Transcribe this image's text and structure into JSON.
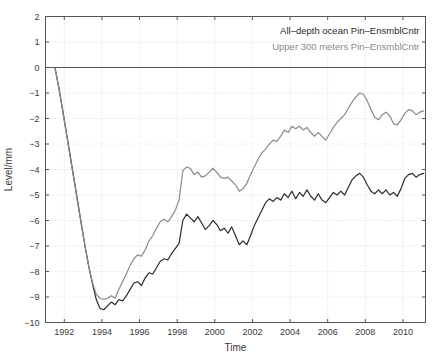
{
  "chart_data": {
    "type": "line",
    "title": "",
    "xlabel": "Time",
    "ylabel": "Level/mm",
    "xlim": [
      1991.0,
      2011.2
    ],
    "ylim": [
      -10,
      2
    ],
    "xticks": [
      1992,
      1994,
      1996,
      1998,
      2000,
      2002,
      2004,
      2006,
      2008,
      2010
    ],
    "xticklabels": [
      "1992",
      "1994",
      "1996",
      "1998",
      "2000",
      "2002",
      "2004",
      "2006",
      "2008",
      "2010"
    ],
    "yticks": [
      2,
      1,
      0,
      -1,
      -2,
      -3,
      -4,
      -5,
      -6,
      -7,
      -8,
      -9,
      -10
    ],
    "yticklabels": [
      "2",
      "1",
      "0",
      "-1",
      "-2",
      "-3",
      "-4",
      "-5",
      "-6",
      "-7",
      "-8",
      "-9",
      "-10"
    ],
    "grid": true,
    "grid_style": "dotted",
    "grid_color": "#cccccc",
    "legend_position": "upper right inside",
    "series": [
      {
        "name": "All-depth ocean Pin-EnsmblCntr",
        "color": "#2b2b2b",
        "linewidth": 1.2,
        "x": [
          1991.5,
          1991.7,
          1991.9,
          1992.1,
          1992.3,
          1992.5,
          1992.7,
          1992.9,
          1993.1,
          1993.3,
          1993.5,
          1993.7,
          1993.9,
          1994.1,
          1994.3,
          1994.5,
          1994.7,
          1994.9,
          1995.1,
          1995.3,
          1995.5,
          1995.7,
          1995.9,
          1996.1,
          1996.3,
          1996.5,
          1996.7,
          1996.9,
          1997.1,
          1997.3,
          1997.5,
          1997.7,
          1997.9,
          1998.1,
          1998.3,
          1998.5,
          1998.7,
          1998.9,
          1999.1,
          1999.3,
          1999.5,
          1999.7,
          1999.9,
          2000.1,
          2000.3,
          2000.5,
          2000.7,
          2000.9,
          2001.1,
          2001.3,
          2001.5,
          2001.7,
          2001.9,
          2002.1,
          2002.3,
          2002.5,
          2002.7,
          2002.9,
          2003.1,
          2003.3,
          2003.5,
          2003.7,
          2003.9,
          2004.1,
          2004.3,
          2004.5,
          2004.7,
          2004.9,
          2005.1,
          2005.3,
          2005.5,
          2005.7,
          2005.9,
          2006.1,
          2006.3,
          2006.5,
          2006.7,
          2006.9,
          2007.1,
          2007.3,
          2007.5,
          2007.7,
          2007.9,
          2008.1,
          2008.3,
          2008.5,
          2008.7,
          2008.9,
          2009.1,
          2009.3,
          2009.5,
          2009.7,
          2009.9,
          2010.1,
          2010.3,
          2010.5,
          2010.7,
          2010.9,
          2011.1
        ],
        "y": [
          0.0,
          -0.75,
          -1.6,
          -2.5,
          -3.4,
          -4.3,
          -5.2,
          -6.1,
          -7.0,
          -7.8,
          -8.5,
          -9.1,
          -9.45,
          -9.5,
          -9.35,
          -9.2,
          -9.3,
          -9.1,
          -9.15,
          -8.95,
          -8.7,
          -8.45,
          -8.4,
          -8.55,
          -8.25,
          -8.05,
          -8.1,
          -7.85,
          -7.6,
          -7.5,
          -7.55,
          -7.3,
          -7.1,
          -6.9,
          -6.0,
          -5.75,
          -5.9,
          -6.05,
          -5.85,
          -6.1,
          -6.35,
          -6.2,
          -6.0,
          -6.15,
          -6.4,
          -6.3,
          -6.5,
          -6.25,
          -6.6,
          -6.95,
          -6.8,
          -6.95,
          -6.6,
          -6.2,
          -5.9,
          -5.6,
          -5.3,
          -5.15,
          -5.25,
          -5.1,
          -5.2,
          -4.95,
          -5.1,
          -4.85,
          -5.15,
          -4.9,
          -5.05,
          -4.8,
          -5.05,
          -5.2,
          -4.95,
          -5.2,
          -5.3,
          -5.1,
          -4.9,
          -5.0,
          -4.85,
          -5.0,
          -4.7,
          -4.4,
          -4.25,
          -4.15,
          -4.3,
          -4.6,
          -4.85,
          -4.95,
          -4.8,
          -4.95,
          -4.8,
          -5.0,
          -4.9,
          -5.05,
          -4.75,
          -4.35,
          -4.2,
          -4.15,
          -4.3,
          -4.2,
          -4.15
        ]
      },
      {
        "name": "Upper 300 meters Pin-EnsmblCntr",
        "color": "#8a8a8a",
        "linewidth": 1.2,
        "x": [
          1991.5,
          1991.7,
          1991.9,
          1992.1,
          1992.3,
          1992.5,
          1992.7,
          1992.9,
          1993.1,
          1993.3,
          1993.5,
          1993.7,
          1993.9,
          1994.1,
          1994.3,
          1994.5,
          1994.7,
          1994.9,
          1995.1,
          1995.3,
          1995.5,
          1995.7,
          1995.9,
          1996.1,
          1996.3,
          1996.5,
          1996.7,
          1996.9,
          1997.1,
          1997.3,
          1997.5,
          1997.7,
          1997.9,
          1998.1,
          1998.3,
          1998.5,
          1998.7,
          1998.9,
          1999.1,
          1999.3,
          1999.5,
          1999.7,
          1999.9,
          2000.1,
          2000.3,
          2000.5,
          2000.7,
          2000.9,
          2001.1,
          2001.3,
          2001.5,
          2001.7,
          2001.9,
          2002.1,
          2002.3,
          2002.5,
          2002.7,
          2002.9,
          2003.1,
          2003.3,
          2003.5,
          2003.7,
          2003.9,
          2004.1,
          2004.3,
          2004.5,
          2004.7,
          2004.9,
          2005.1,
          2005.3,
          2005.5,
          2005.7,
          2005.9,
          2006.1,
          2006.3,
          2006.5,
          2006.7,
          2006.9,
          2007.1,
          2007.3,
          2007.5,
          2007.7,
          2007.9,
          2008.1,
          2008.3,
          2008.5,
          2008.7,
          2008.9,
          2009.1,
          2009.3,
          2009.5,
          2009.7,
          2009.9,
          2010.1,
          2010.3,
          2010.5,
          2010.7,
          2010.9,
          2011.1
        ],
        "y": [
          0.0,
          -0.78,
          -1.65,
          -2.55,
          -3.45,
          -4.35,
          -5.25,
          -6.15,
          -7.0,
          -7.8,
          -8.45,
          -8.9,
          -9.05,
          -9.1,
          -9.05,
          -8.95,
          -9.05,
          -8.7,
          -8.4,
          -8.1,
          -7.75,
          -7.5,
          -7.35,
          -7.4,
          -7.15,
          -6.8,
          -6.6,
          -6.3,
          -6.05,
          -5.95,
          -6.05,
          -5.85,
          -5.6,
          -5.2,
          -4.05,
          -3.9,
          -3.95,
          -4.2,
          -4.1,
          -4.3,
          -4.25,
          -4.1,
          -3.95,
          -4.1,
          -4.3,
          -4.35,
          -4.3,
          -4.45,
          -4.6,
          -4.85,
          -4.75,
          -4.55,
          -4.2,
          -3.9,
          -3.6,
          -3.35,
          -3.2,
          -3.0,
          -2.85,
          -2.9,
          -2.7,
          -2.45,
          -2.55,
          -2.3,
          -2.4,
          -2.3,
          -2.45,
          -2.35,
          -2.55,
          -2.7,
          -2.55,
          -2.7,
          -2.85,
          -2.6,
          -2.35,
          -2.15,
          -2.0,
          -1.85,
          -1.6,
          -1.35,
          -1.15,
          -1.0,
          -1.05,
          -1.3,
          -1.65,
          -1.95,
          -2.05,
          -1.85,
          -1.75,
          -1.9,
          -2.2,
          -2.25,
          -2.05,
          -1.8,
          -1.65,
          -1.7,
          -1.85,
          -1.75,
          -1.7
        ]
      }
    ]
  },
  "legend": {
    "entries": [
      {
        "label": "All–depth ocean Pin–EnsmblCntr",
        "color": "#2b2b2b"
      },
      {
        "label": "Upper 300 meters Pin–EnsmblCntr",
        "color": "#8a8a8a"
      }
    ]
  },
  "axes": {
    "x_title": "Time",
    "y_title": "Level/mm"
  },
  "style": {
    "frame_color": "#555555",
    "grid_color": "#cfcfcf",
    "background": "#ffffff",
    "tick_color": "#555555"
  }
}
